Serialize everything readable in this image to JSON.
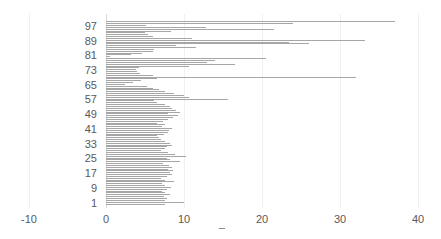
{
  "chart_data": {
    "type": "bar",
    "orientation": "horizontal",
    "title": "",
    "xlabel": "",
    "ylabel": "",
    "xlim": [
      -10,
      40
    ],
    "x_ticks": [
      "-10",
      "0",
      "10",
      "20",
      "30",
      "40"
    ],
    "y_tick_labels": [
      "1",
      "9",
      "17",
      "25",
      "33",
      "41",
      "49",
      "57",
      "65",
      "73",
      "81",
      "89",
      "97"
    ],
    "grid": true,
    "legend": "none",
    "categories_count": 100,
    "series": [
      {
        "name": "values",
        "color": "#a6a6a6",
        "values": [
          7.5,
          10,
          7.6,
          7.8,
          7.4,
          8.2,
          7.6,
          7.2,
          7.8,
          8.3,
          7.6,
          7.2,
          8.7,
          7.5,
          7,
          7.8,
          8.5,
          8.2,
          8.6,
          7.9,
          8.5,
          8.1,
          7.3,
          9.5,
          8.2,
          7.8,
          10.2,
          8.8,
          8,
          7,
          7.5,
          7.8,
          8.4,
          8.2,
          7.6,
          7.1,
          6.8,
          6.5,
          7.4,
          8,
          8.1,
          8.5,
          7.2,
          7.6,
          6.5,
          7.3,
          7.9,
          8.6,
          9.2,
          8,
          9.5,
          9,
          8.5,
          8.2,
          7.5,
          6.6,
          6.2,
          15.6,
          10.6,
          10,
          8.7,
          7.6,
          6.8,
          6,
          5.2,
          2.4,
          3.5,
          4.5,
          6.5,
          32,
          6,
          4.4,
          4,
          3.9,
          4.2,
          10.7,
          16.6,
          13,
          14,
          20.5,
          0.5,
          3.2,
          4.6,
          6,
          6.2,
          11.5,
          9,
          26,
          23.4,
          33.2,
          11,
          6,
          5.4,
          5,
          8.3,
          21.5,
          12.8,
          5.1,
          24,
          37
        ]
      }
    ]
  }
}
